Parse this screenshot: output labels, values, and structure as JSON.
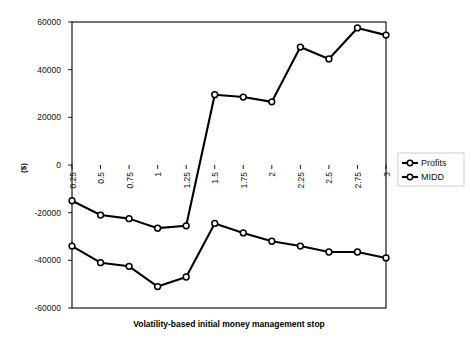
{
  "chart_data": {
    "type": "line",
    "title": "",
    "xlabel": "Volatility-based initial money management stop",
    "ylabel": "($)",
    "categories": [
      "0.25",
      "0.5",
      "0.75",
      "1",
      "1.25",
      "1.5",
      "1.75",
      "2",
      "2.25",
      "2.5",
      "2.75",
      "3"
    ],
    "series": [
      {
        "name": "Profits",
        "values": [
          -15000,
          -21000,
          -22500,
          -26500,
          -25500,
          29500,
          28500,
          26500,
          49500,
          44500,
          57500,
          54500
        ]
      },
      {
        "name": "MIDD",
        "values": [
          -34000,
          -41000,
          -42500,
          -51000,
          -47000,
          -24500,
          -28500,
          -32000,
          -34000,
          -36500,
          -36500,
          -39000
        ]
      }
    ],
    "ylim": [
      -60000,
      60000
    ],
    "yticks": [
      "60000",
      "40000",
      "20000",
      "0",
      "-20000",
      "-40000",
      "-60000"
    ],
    "ytick_values": [
      60000,
      40000,
      20000,
      0,
      -20000,
      -40000,
      -60000
    ],
    "grid": true,
    "legend_position": "right",
    "legend_entries": [
      "Profits",
      "MIDD"
    ],
    "marker": "open-circle",
    "line_color": "#000000",
    "grid_color": "#9a9a9a",
    "background_color": "#ffffff"
  },
  "layout": {
    "plot_left": 72,
    "plot_right": 386,
    "plot_top": 22,
    "plot_bottom": 308
  }
}
